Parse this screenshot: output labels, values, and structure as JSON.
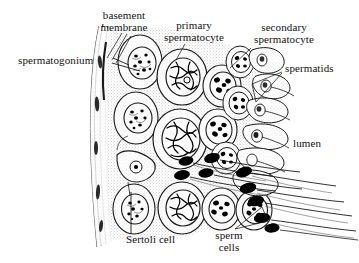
{
  "figure": {
    "background_color": "#ffffff",
    "ink_color": "#111111",
    "tissue_fill": "#e8e8e8",
    "nucleus_fill": "#f2f2f2",
    "chromatin_color": "#000000"
  },
  "labels": {
    "basement_membrane": "basement\nmembrane",
    "spermatogonium": "spermatogonium",
    "primary_spermatocyte": "primary\nspermatocyte",
    "secondary_spermatocyte": "secondary\nspermatocyte",
    "spermatids": "spermatids",
    "lumen": "lumen",
    "sertoli_cell": "Sertoli cell",
    "sperm_cells": "sperm\ncells"
  },
  "structures": [
    {
      "name": "basement-membrane",
      "description": "fibrous layer along left curved edge of tubule"
    },
    {
      "name": "spermatogonium",
      "description": "outermost germ cells adjacent to basement membrane"
    },
    {
      "name": "primary-spermatocyte",
      "description": "large cells with tangled thread-like chromatin"
    },
    {
      "name": "secondary-spermatocyte",
      "description": "smaller cells with discrete dark chromosome blobs"
    },
    {
      "name": "spermatid",
      "description": "elongating cells near lumen with condensing nuclei"
    },
    {
      "name": "sperm-cell",
      "description": "mature sperm with dark teardrop head and long flagellum"
    },
    {
      "name": "sertoli-cell",
      "description": "triangular supporting cell with small round nucleus"
    },
    {
      "name": "lumen",
      "description": "open central cavity of the seminiferous tubule at right"
    }
  ]
}
